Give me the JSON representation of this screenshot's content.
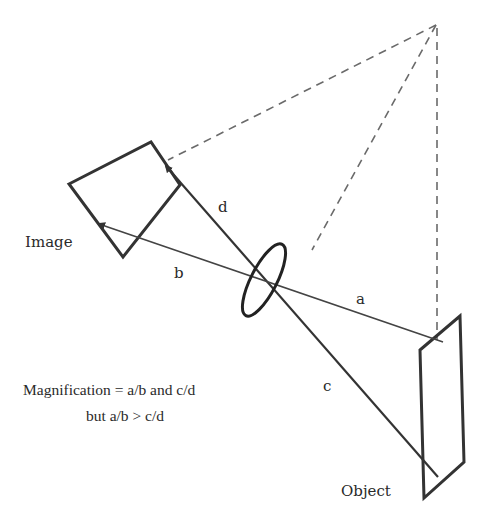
{
  "diagram": {
    "labels": {
      "image": "Image",
      "object": "Object",
      "a": "a",
      "b": "b",
      "c": "c",
      "d": "d"
    },
    "caption": {
      "line1": "Magnification = a/b and c/d",
      "line2": "but a/b > c/d"
    },
    "colors": {
      "stroke": "#333333",
      "dashed": "#6a6a6a",
      "background": "#ffffff"
    }
  }
}
